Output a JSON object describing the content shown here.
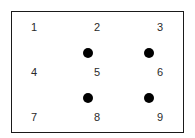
{
  "diagram": {
    "numbers": [
      {
        "label": "1",
        "x": 34,
        "y": 27
      },
      {
        "label": "2",
        "x": 97,
        "y": 27
      },
      {
        "label": "3",
        "x": 160,
        "y": 27
      },
      {
        "label": "4",
        "x": 34,
        "y": 72
      },
      {
        "label": "5",
        "x": 97,
        "y": 72
      },
      {
        "label": "6",
        "x": 160,
        "y": 72
      },
      {
        "label": "7",
        "x": 34,
        "y": 117
      },
      {
        "label": "8",
        "x": 97,
        "y": 117
      },
      {
        "label": "9",
        "x": 160,
        "y": 117
      }
    ],
    "dots": [
      {
        "x": 88,
        "y": 53
      },
      {
        "x": 149,
        "y": 53
      },
      {
        "x": 88,
        "y": 98
      },
      {
        "x": 149,
        "y": 98
      }
    ],
    "colors": {
      "border": "#1a1a1a",
      "dot": "#000000",
      "text": "#2a2a2a"
    }
  }
}
